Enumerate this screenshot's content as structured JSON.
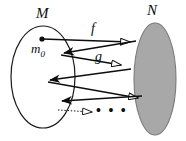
{
  "figure": {
    "background_color": "#ffffff",
    "ink_color": "#0d0d0d",
    "sets": [
      {
        "name": "M",
        "label": "M",
        "role": "domain",
        "shape": "ellipse",
        "fill_color": "#ffffff",
        "stroke_color": "#1a1a1a",
        "cx": 43,
        "cy": 77,
        "rx": 32,
        "ry": 51
      },
      {
        "name": "N",
        "label": "N",
        "role": "codomain",
        "shape": "ellipse",
        "fill_color": "#a8a8a8",
        "stroke_color": "#6e6e6e",
        "cx": 155,
        "cy": 79,
        "rx": 21,
        "ry": 56
      }
    ],
    "point": {
      "label": "m",
      "subscript": "0",
      "label_full": "m0",
      "x": 42,
      "y": 39
    },
    "map_labels": [
      {
        "name": "f",
        "label": "f",
        "x": 91,
        "y": 22
      },
      {
        "name": "g",
        "label": "g",
        "x": 95,
        "y": 50
      }
    ],
    "ellipsis": "• • •",
    "arrows": [
      {
        "name": "arrow-f-forward",
        "style": "solid",
        "head": "hollow",
        "from": [
          42,
          39
        ],
        "to": [
          131,
          42
        ]
      },
      {
        "name": "arrow-back-1",
        "style": "solid",
        "head": "solid",
        "from": [
          133,
          41
        ],
        "to": [
          62,
          53
        ]
      },
      {
        "name": "arrow-g-forward",
        "style": "solid",
        "head": "hollow",
        "from": [
          62,
          54
        ],
        "to": [
          122,
          65
        ]
      },
      {
        "name": "arrow-back-2",
        "style": "solid",
        "head": "solid",
        "from": [
          128,
          68
        ],
        "to": [
          48,
          80
        ]
      },
      {
        "name": "arrow-forward-3",
        "style": "solid",
        "head": "hollow",
        "from": [
          49,
          81
        ],
        "to": [
          139,
          98
        ]
      },
      {
        "name": "arrow-back-3",
        "style": "solid",
        "head": "solid",
        "from": [
          140,
          97
        ],
        "to": [
          60,
          100
        ]
      },
      {
        "name": "arrow-dotted",
        "style": "dotted",
        "head": "hollow",
        "from": [
          58,
          110
        ],
        "to": [
          93,
          112
        ]
      }
    ]
  }
}
